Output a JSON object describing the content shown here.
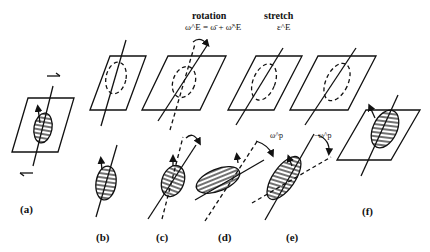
{
  "headers": {
    "rotation": {
      "title": "rotation",
      "equation": "ω^E = ω̄ + ω̃^E"
    },
    "stretch": {
      "title": "stretch",
      "equation": "ε^E"
    }
  },
  "annotations": {
    "omega_p": "ω^p",
    "neg_omega_p": "−ω^p"
  },
  "panel_labels": [
    "(a)",
    "(b)",
    "(c)",
    "(d)",
    "(e)",
    "(f)"
  ],
  "colors": {
    "ink": "#111111",
    "background": "#ffffff"
  }
}
